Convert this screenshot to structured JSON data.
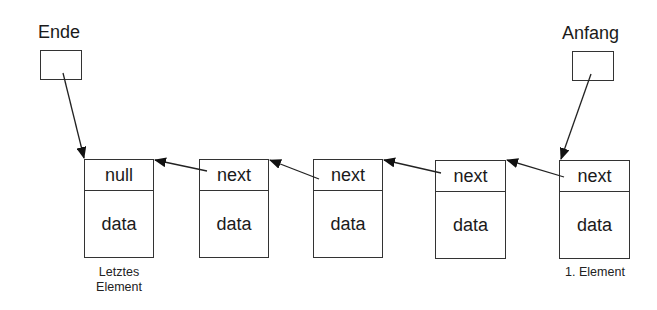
{
  "diagram": {
    "type": "singly-linked-list",
    "pointers": {
      "end": {
        "label": "Ende"
      },
      "start": {
        "label": "Anfang"
      }
    },
    "nodes": [
      {
        "ref": "null",
        "value": "data",
        "caption": "Letztes Element"
      },
      {
        "ref": "next",
        "value": "data"
      },
      {
        "ref": "next",
        "value": "data"
      },
      {
        "ref": "next",
        "value": "data"
      },
      {
        "ref": "next",
        "value": "data",
        "caption": "1. Element"
      }
    ],
    "captions": {
      "last_line1": "Letztes",
      "last_line2": "Element",
      "first": "1. Element"
    },
    "edges": [
      {
        "from": "Ende",
        "to": "node-0"
      },
      {
        "from": "Anfang",
        "to": "node-4"
      },
      {
        "from": "node-4.next",
        "to": "node-3"
      },
      {
        "from": "node-3.next",
        "to": "node-2"
      },
      {
        "from": "node-2.next",
        "to": "node-1"
      },
      {
        "from": "node-1.next",
        "to": "node-0"
      }
    ]
  }
}
